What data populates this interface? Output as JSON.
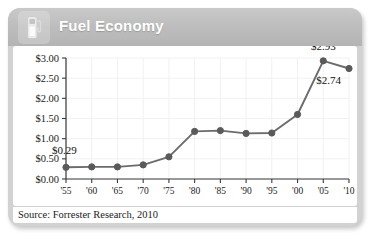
{
  "card": {
    "header": {
      "title": "Fuel Economy",
      "icon": "gas-pump-icon",
      "background_color": "#bdbdbd",
      "title_color": "#ffffff"
    },
    "footer": {
      "source": "Source: Forrester Research, 2010"
    }
  },
  "chart_data": {
    "type": "line",
    "title": "Fuel Economy",
    "xlabel": "",
    "ylabel": "",
    "categories": [
      "'55",
      "'60",
      "'65",
      "'70",
      "'75",
      "'80",
      "'85",
      "'90",
      "'95",
      "'00",
      "'05",
      "'10"
    ],
    "values": [
      0.29,
      0.3,
      0.3,
      0.35,
      0.55,
      1.18,
      1.2,
      1.13,
      1.14,
      1.6,
      2.93,
      2.74
    ],
    "ylim": [
      0.0,
      3.0
    ],
    "ytick_labels": [
      "$3.00",
      "$2.50",
      "$2.00",
      "$1.50",
      "$1.00",
      "$0.50",
      "$0.00"
    ],
    "ytick_values": [
      3.0,
      2.5,
      2.0,
      1.5,
      1.0,
      0.5,
      0.0
    ],
    "grid": true,
    "legend": "none",
    "series_color": "#6b6b6b",
    "marker_color": "#5a5a5a",
    "annotations": [
      {
        "label": "$0.29",
        "category": "'55",
        "value": 0.29
      },
      {
        "label": "$2.93",
        "category": "'05",
        "value": 2.93
      },
      {
        "label": "$2.74",
        "category": "'10",
        "value": 2.74
      }
    ]
  }
}
